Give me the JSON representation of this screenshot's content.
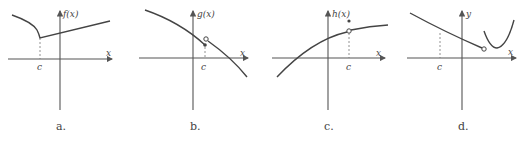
{
  "panels": [
    {
      "id": "a",
      "caption": "a.",
      "func_label": "f(x)",
      "x_label": "x",
      "c_label": "c"
    },
    {
      "id": "b",
      "caption": "b.",
      "func_label": "g(x)",
      "x_label": "x",
      "c_label": "c"
    },
    {
      "id": "c",
      "caption": "c.",
      "func_label": "h(x)",
      "x_label": "x",
      "c_label": "c"
    },
    {
      "id": "d",
      "caption": "d.",
      "func_label": "y",
      "x_label": "x",
      "c_label": "c"
    }
  ]
}
